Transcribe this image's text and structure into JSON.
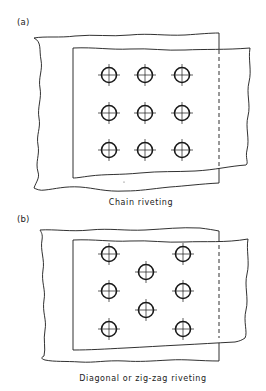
{
  "figure": {
    "panels": [
      {
        "id": "a",
        "label": "(a)",
        "caption": "Chain riveting",
        "rivets": [
          {
            "x": 109,
            "y": 75
          },
          {
            "x": 145,
            "y": 75
          },
          {
            "x": 182,
            "y": 75
          },
          {
            "x": 109,
            "y": 113
          },
          {
            "x": 145,
            "y": 113
          },
          {
            "x": 182,
            "y": 113
          },
          {
            "x": 109,
            "y": 150
          },
          {
            "x": 145,
            "y": 150
          },
          {
            "x": 182,
            "y": 150
          }
        ]
      },
      {
        "id": "b",
        "label": "(b)",
        "caption": "Diagonal or zig-zag riveting",
        "rivets": [
          {
            "x": 109,
            "y": 254
          },
          {
            "x": 183,
            "y": 254
          },
          {
            "x": 146,
            "y": 272
          },
          {
            "x": 109,
            "y": 291
          },
          {
            "x": 183,
            "y": 291
          },
          {
            "x": 146,
            "y": 310
          },
          {
            "x": 109,
            "y": 329
          },
          {
            "x": 183,
            "y": 329
          }
        ]
      }
    ],
    "colors": {
      "line": "#1a1a1a",
      "background": "#ffffff"
    }
  }
}
